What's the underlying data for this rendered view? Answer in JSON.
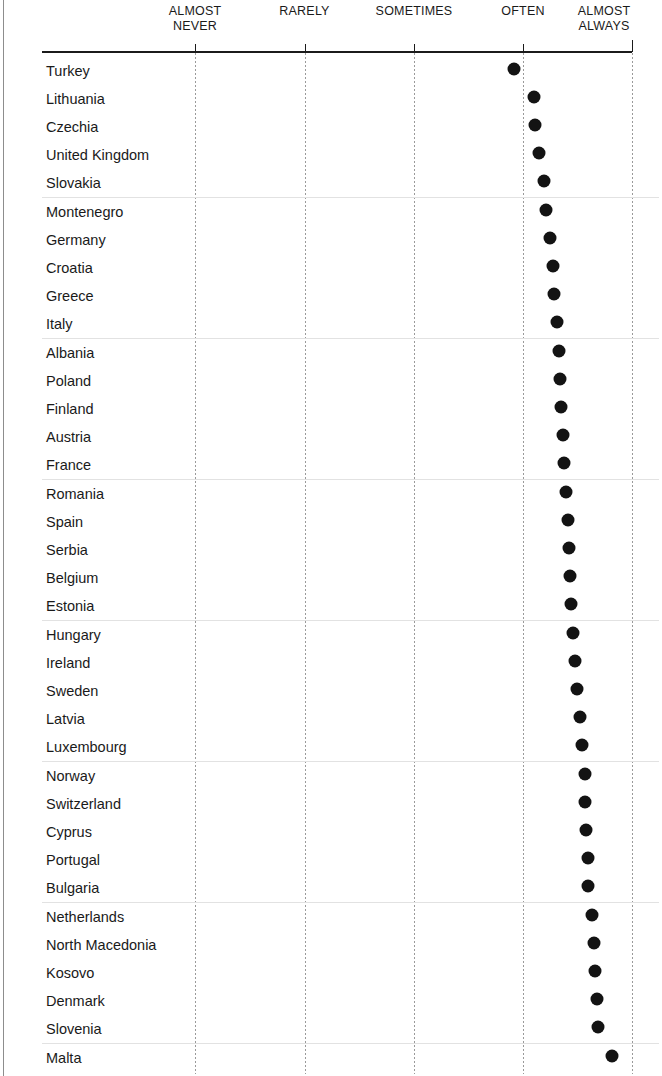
{
  "chart_data": {
    "type": "scatter",
    "title": "",
    "subtitle": "",
    "xlabel": "",
    "ylabel": "",
    "orientation": "horizontal",
    "grid": {
      "vertical": true,
      "horizontal": true,
      "horizontal_every_n_rows": 5
    },
    "legend": null,
    "axis": {
      "position": "top",
      "tick_labels": [
        "ALMOST\nNEVER",
        "RARELY",
        "SOMETIMES",
        "OFTEN",
        "ALMOST\nALWAYS"
      ],
      "tick_values": [
        1,
        2,
        3,
        4,
        5
      ],
      "xlim": [
        0.22,
        5.0
      ]
    },
    "categories": [
      "Turkey",
      "Lithuania",
      "Czechia",
      "United Kingdom",
      "Slovakia",
      "Montenegro",
      "Germany",
      "Croatia",
      "Greece",
      "Italy",
      "Albania",
      "Poland",
      "Finland",
      "Austria",
      "France",
      "Romania",
      "Spain",
      "Serbia",
      "Belgium",
      "Estonia",
      "Hungary",
      "Ireland",
      "Sweden",
      "Latvia",
      "Luxembourg",
      "Norway",
      "Switzerland",
      "Cyprus",
      "Portugal",
      "Bulgaria",
      "Netherlands",
      "North Macedonia",
      "Kosovo",
      "Denmark",
      "Slovenia",
      "Malta"
    ],
    "values": [
      3.92,
      4.1,
      4.11,
      4.15,
      4.19,
      4.21,
      4.25,
      4.28,
      4.29,
      4.31,
      4.33,
      4.34,
      4.35,
      4.37,
      4.38,
      4.4,
      4.41,
      4.42,
      4.43,
      4.44,
      4.46,
      4.48,
      4.5,
      4.52,
      4.54,
      4.57,
      4.57,
      4.58,
      4.6,
      4.6,
      4.63,
      4.65,
      4.66,
      4.68,
      4.69,
      4.82
    ],
    "marker": {
      "shape": "circle",
      "color": "#131313",
      "size_px": 13
    }
  },
  "colors": {
    "marker": "#131313",
    "axis": "#1b1b1b",
    "vertical_grid": "#9a9a9a",
    "horizontal_grid": "#e2e2e2",
    "text": "#1a1a1a",
    "background": "#ffffff"
  }
}
